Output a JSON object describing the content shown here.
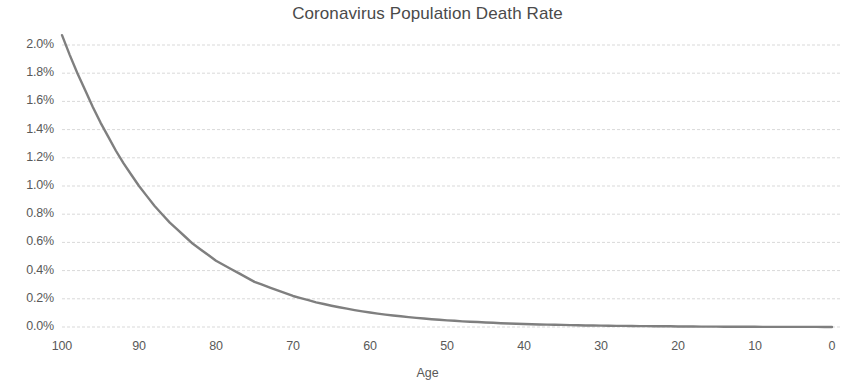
{
  "chart_data": {
    "type": "line",
    "title": "Coronavirus Population Death Rate",
    "xlabel": "Age",
    "ylabel": "",
    "x": [
      100,
      99,
      98,
      97,
      96,
      95,
      94,
      93,
      92,
      91,
      90,
      89,
      88,
      87,
      86,
      85,
      84,
      83,
      82,
      81,
      80,
      79,
      78,
      77,
      76,
      75,
      74,
      73,
      72,
      71,
      70,
      69,
      68,
      67,
      66,
      65,
      64,
      63,
      62,
      61,
      60,
      59,
      58,
      57,
      56,
      55,
      54,
      53,
      52,
      51,
      50,
      49,
      48,
      47,
      46,
      45,
      44,
      43,
      42,
      41,
      40,
      39,
      38,
      37,
      36,
      35,
      34,
      33,
      32,
      31,
      30,
      29,
      28,
      27,
      26,
      25,
      24,
      23,
      22,
      21,
      20,
      19,
      18,
      17,
      16,
      15,
      14,
      13,
      12,
      11,
      10,
      9,
      8,
      7,
      6,
      5,
      4,
      3,
      2,
      1,
      0
    ],
    "values": [
      2.07,
      1.93,
      1.8,
      1.68,
      1.56,
      1.45,
      1.35,
      1.25,
      1.16,
      1.08,
      1.0,
      0.93,
      0.86,
      0.8,
      0.74,
      0.69,
      0.64,
      0.59,
      0.55,
      0.51,
      0.47,
      0.44,
      0.41,
      0.38,
      0.35,
      0.32,
      0.3,
      0.28,
      0.26,
      0.24,
      0.22,
      0.205,
      0.19,
      0.175,
      0.163,
      0.151,
      0.14,
      0.13,
      0.12,
      0.111,
      0.103,
      0.095,
      0.088,
      0.082,
      0.076,
      0.07,
      0.065,
      0.06,
      0.055,
      0.051,
      0.047,
      0.044,
      0.04,
      0.037,
      0.035,
      0.032,
      0.03,
      0.027,
      0.025,
      0.023,
      0.021,
      0.02,
      0.018,
      0.017,
      0.016,
      0.015,
      0.013,
      0.012,
      0.011,
      0.011,
      0.01,
      0.009,
      0.008,
      0.008,
      0.007,
      0.006,
      0.006,
      0.005,
      0.005,
      0.005,
      0.004,
      0.004,
      0.004,
      0.003,
      0.003,
      0.003,
      0.002,
      0.002,
      0.002,
      0.002,
      0.002,
      0.001,
      0.001,
      0.001,
      0.001,
      0.001,
      0.001,
      0.001,
      0.001,
      0.0,
      0.0
    ],
    "xlim": [
      100,
      0
    ],
    "ylim": [
      0.0,
      2.0
    ],
    "x_reversed": true,
    "xticks": [
      "100",
      "90",
      "80",
      "70",
      "60",
      "50",
      "40",
      "30",
      "20",
      "10",
      "0"
    ],
    "yticks": [
      "2.0%",
      "1.8%",
      "1.6%",
      "1.4%",
      "1.2%",
      "1.0%",
      "0.8%",
      "0.6%",
      "0.4%",
      "0.2%",
      "0.0%"
    ],
    "grid": "horizontal-dashed",
    "legend": null,
    "series_name": "Death Rate",
    "line_color": "#7f7f7f",
    "grid_color": "#d9d9d9",
    "text_color": "#595959",
    "background": "#ffffff"
  }
}
